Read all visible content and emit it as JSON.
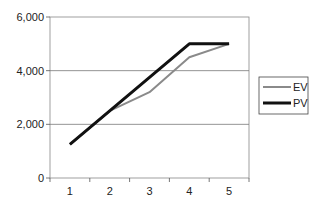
{
  "chart_data": {
    "type": "line",
    "title": "",
    "xlabel": "",
    "ylabel": "",
    "categories": [
      "1",
      "2",
      "3",
      "4",
      "5"
    ],
    "series": [
      {
        "name": "EV",
        "color": "#8a8a8a",
        "values": [
          1250,
          2500,
          3200,
          4500,
          5000
        ]
      },
      {
        "name": "PV",
        "color": "#111111",
        "values": [
          1250,
          2500,
          3750,
          5000,
          5000
        ]
      }
    ],
    "ylim": [
      0,
      6000
    ],
    "yticks": [
      "0",
      "2,000",
      "4,000",
      "6,000"
    ],
    "grid": true,
    "legend_position": "right"
  },
  "legend": {
    "items": [
      {
        "label": "EV"
      },
      {
        "label": "PV"
      }
    ]
  }
}
